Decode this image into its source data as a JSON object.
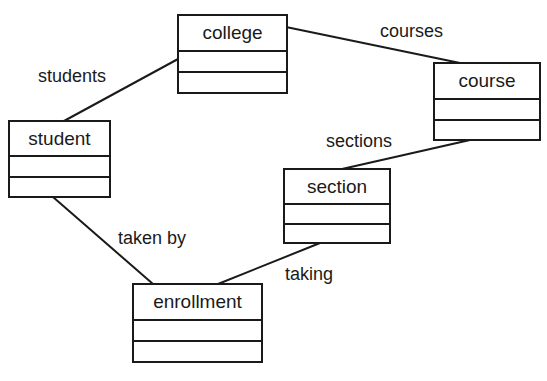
{
  "diagram": {
    "type": "UML class diagram",
    "classes": [
      {
        "id": "college",
        "name": "college",
        "attributes": [],
        "operations": []
      },
      {
        "id": "course",
        "name": "course",
        "attributes": [],
        "operations": []
      },
      {
        "id": "student",
        "name": "student",
        "attributes": [],
        "operations": []
      },
      {
        "id": "section",
        "name": "section",
        "attributes": [],
        "operations": []
      },
      {
        "id": "enrollment",
        "name": "enrollment",
        "attributes": [],
        "operations": []
      }
    ],
    "associations": [
      {
        "from": "college",
        "to": "student",
        "label": "students"
      },
      {
        "from": "college",
        "to": "course",
        "label": "courses"
      },
      {
        "from": "course",
        "to": "section",
        "label": "sections"
      },
      {
        "from": "student",
        "to": "enrollment",
        "label": "taken by"
      },
      {
        "from": "section",
        "to": "enrollment",
        "label": "taking"
      }
    ]
  }
}
